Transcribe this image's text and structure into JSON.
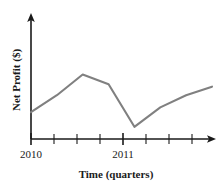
{
  "chart_data": {
    "type": "line",
    "title": "",
    "subtitle": "",
    "xlabel": "Time (quarters)",
    "ylabel": "Net Profit ($)",
    "grid": false,
    "legend": null,
    "legend_position": "none",
    "line_color": "#808080",
    "axis_color": "#1a1a1a",
    "background_color": "#ffffff",
    "axis_style": "arrowed-L-axes",
    "xlim": [
      0,
      10
    ],
    "ylim": [
      0,
      10
    ],
    "y_tick_labels": [],
    "x_tick_labels": [
      {
        "label": "2010",
        "x": 0
      },
      {
        "label": "2011",
        "x": 4
      }
    ],
    "x_minor_tick_count": 9,
    "categories": [
      "2010 Q1",
      "2010 Q2",
      "2010 Q3",
      "2010 Q4",
      "2011 Q1",
      "2011 Q2",
      "2011 Q3",
      "2011 Q4"
    ],
    "x": [
      0,
      1,
      2,
      3,
      4,
      5,
      6,
      7
    ],
    "values": [
      2.2,
      3.6,
      5.3,
      4.5,
      1.0,
      2.6,
      3.6,
      4.3
    ],
    "series": [
      {
        "name": "Net Profit",
        "color": "#808080",
        "points": [
          {
            "x": 0,
            "y": 2.2
          },
          {
            "x": 1,
            "y": 3.6
          },
          {
            "x": 2,
            "y": 5.3
          },
          {
            "x": 3,
            "y": 4.5
          },
          {
            "x": 4,
            "y": 1.0
          },
          {
            "x": 5,
            "y": 2.6
          },
          {
            "x": 6,
            "y": 3.6
          },
          {
            "x": 7,
            "y": 4.3
          }
        ]
      }
    ],
    "annotations": []
  },
  "artifact": {
    "top_fragment": "· ·"
  }
}
